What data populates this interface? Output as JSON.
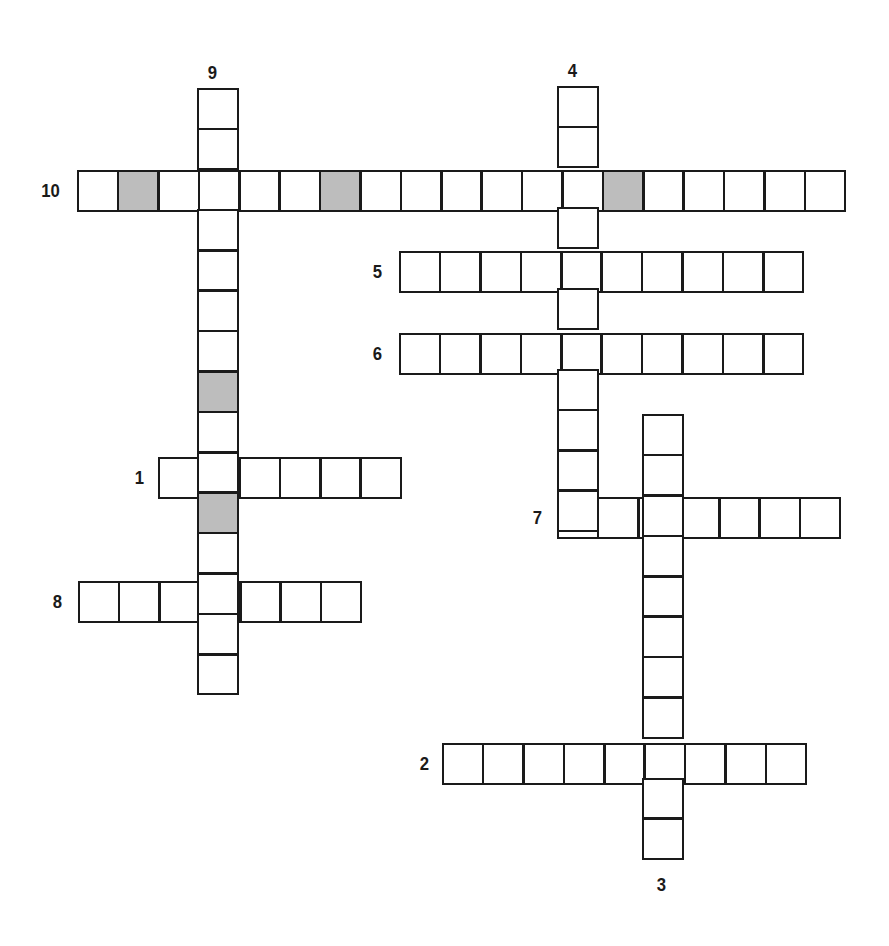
{
  "puzzle": {
    "type": "crossword",
    "cell_size": 40.4,
    "colors": {
      "border": "#1a1a1a",
      "empty": "#ffffff",
      "shaded": "#bdbdbd"
    },
    "words": [
      {
        "number": "10",
        "direction": "across",
        "length": 19,
        "x": 77,
        "y": 170,
        "shaded": [
          1,
          6,
          13
        ],
        "label_x": 40,
        "label_y": 181
      },
      {
        "number": "5",
        "direction": "across",
        "length": 10,
        "x": 399,
        "y": 251,
        "shaded": [],
        "label_x": 372,
        "label_y": 262
      },
      {
        "number": "6",
        "direction": "across",
        "length": 10,
        "x": 399,
        "y": 333,
        "shaded": [],
        "label_x": 372,
        "label_y": 344
      },
      {
        "number": "1",
        "direction": "across",
        "length": 6,
        "x": 158,
        "y": 457,
        "shaded": [],
        "label_x": 134,
        "label_y": 468
      },
      {
        "number": "7",
        "direction": "across",
        "length": 7,
        "x": 557,
        "y": 497,
        "shaded": [],
        "label_x": 532,
        "label_y": 508
      },
      {
        "number": "8",
        "direction": "across",
        "length": 7,
        "x": 78,
        "y": 581,
        "shaded": [],
        "label_x": 52,
        "label_y": 592
      },
      {
        "number": "2",
        "direction": "across",
        "length": 9,
        "x": 442,
        "y": 743,
        "shaded": [],
        "label_x": 419,
        "label_y": 754
      },
      {
        "number": "9",
        "direction": "down",
        "length": 15,
        "x": 197,
        "y": 88,
        "shaded": [
          7,
          10
        ],
        "label_x": 207,
        "label_y": 63
      },
      {
        "number": "4",
        "direction": "down",
        "length": 11,
        "x": 557,
        "y": 86,
        "shaded": [],
        "label_x": 567,
        "label_y": 61
      },
      {
        "number": "3",
        "direction": "down",
        "length": 11,
        "x": 642,
        "y": 414,
        "shaded": [],
        "label_x": 656,
        "label_y": 875
      }
    ]
  }
}
